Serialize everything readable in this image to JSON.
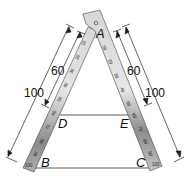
{
  "figure": {
    "points": {
      "A": "A",
      "B": "B",
      "C": "C",
      "D": "D",
      "E": "E"
    },
    "dimensions": {
      "left_outer": "100",
      "left_inner": "60",
      "right_inner": "60",
      "right_outer": "100"
    },
    "ruler_left": {
      "ticks": [
        "10",
        "20",
        "30",
        "40",
        "50",
        "60",
        "70",
        "80",
        "90",
        "100"
      ]
    },
    "ruler_right": {
      "ticks": [
        "10",
        "20",
        "30",
        "40",
        "50",
        "60",
        "70",
        "80",
        "90",
        "100"
      ]
    },
    "colors": {
      "ruler_light": "#e6e6e6",
      "ruler_dark": "#7a7a7a",
      "line": "#333333"
    }
  }
}
